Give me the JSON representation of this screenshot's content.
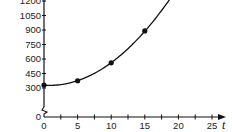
{
  "chart_data": {
    "type": "line",
    "title": "",
    "xlabel": "t",
    "ylabel": "",
    "x": [
      0,
      5,
      10,
      15,
      20
    ],
    "series": [
      {
        "name": "curve",
        "values": [
          330,
          375,
          560,
          890,
          1350
        ],
        "markers": true,
        "smooth": true
      }
    ],
    "x_ticks": [
      0,
      5,
      10,
      15,
      20,
      25
    ],
    "y_ticks": [
      0,
      300,
      450,
      600,
      750,
      900,
      1050,
      1200,
      1350
    ],
    "xlim": [
      0,
      26
    ],
    "ylim": [
      0,
      1380
    ],
    "y_axis_break": true,
    "grid": false,
    "legend": "none"
  },
  "labels": {
    "x_axis_title": "t",
    "x_tick_labels": [
      "0",
      "5",
      "10",
      "15",
      "20",
      "25"
    ],
    "y_tick_labels": [
      "0",
      "300",
      "450",
      "600",
      "750",
      "900",
      "1050",
      "1200",
      "1350"
    ]
  },
  "colors": {
    "line": "#111111",
    "axis": "#111111",
    "text": "#222222"
  }
}
